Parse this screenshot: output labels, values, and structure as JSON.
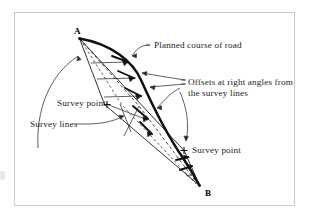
{
  "figure": {
    "type": "surveying-diagram",
    "background_color": "#ffffff",
    "frame_color": "#c9c9c9",
    "ink_color": "#1d1d1d",
    "vertices": {
      "a_label": "A",
      "b_label": "B"
    },
    "annotations": {
      "planned_course": "Planned course of road",
      "offsets_line1": "Offsets at right angles from",
      "offsets_line2": "the survey lines",
      "survey_point_left": "Survey point",
      "survey_point_right": "Survey point",
      "survey_lines": "Survey lines"
    }
  }
}
